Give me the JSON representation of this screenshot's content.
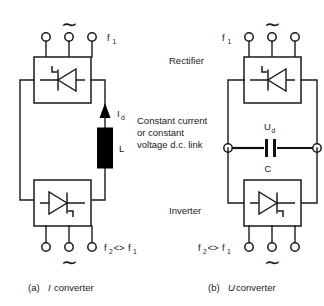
{
  "figure": {
    "background": "#ffffff",
    "line_color": "#1a1a1a"
  },
  "labels": {
    "rectifier": "Rectifier",
    "inverter": "Inverter",
    "dc_link_line1": "Constant current",
    "dc_link_line2": "or constant",
    "dc_link_line3": "voltage d.c. link",
    "ac_symbol": "∼"
  },
  "left_circuit": {
    "name": "I converter",
    "top_freq": "f",
    "top_freq_sub": "1",
    "bottom_freq_f2": "f",
    "bottom_freq_f2_sub": "2",
    "bottom_freq_rel": "<>",
    "bottom_freq_f1": "f",
    "bottom_freq_f1_sub": "1",
    "current_label": "I",
    "current_label_sub": "d",
    "inductor_label": "L",
    "caption_prefix": "(a)",
    "caption_em": "I",
    "caption_suffix": "converter",
    "terminal_count": 3
  },
  "right_circuit": {
    "name": "U converter",
    "top_freq": "f",
    "top_freq_sub": "1",
    "bottom_freq_f2": "f",
    "bottom_freq_f2_sub": "2",
    "bottom_freq_rel": "<>",
    "bottom_freq_f1": "f",
    "bottom_freq_f1_sub": "1",
    "voltage_label": "U",
    "voltage_label_sub": "d",
    "capacitor_label": "C",
    "caption_prefix": "(b)",
    "caption_em": "U",
    "caption_suffix": "converter",
    "terminal_count": 3
  }
}
